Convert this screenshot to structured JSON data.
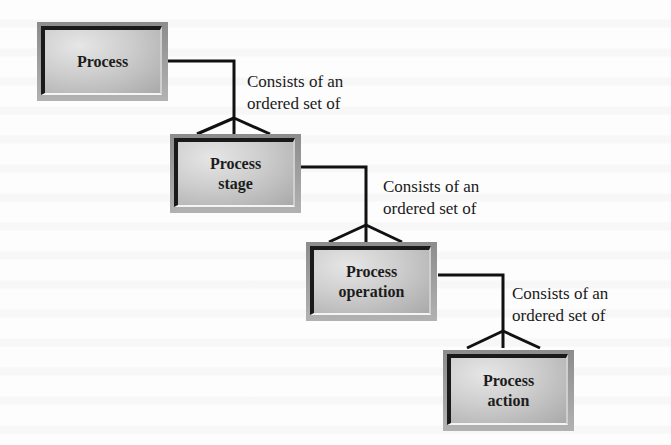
{
  "diagram": {
    "type": "hierarchy",
    "notation": "crow's foot (one-to-many)",
    "nodes": [
      {
        "id": "process",
        "label": "Process"
      },
      {
        "id": "process-stage",
        "label": "Process\nstage"
      },
      {
        "id": "process-operation",
        "label": "Process\noperation"
      },
      {
        "id": "process-action",
        "label": "Process\naction"
      }
    ],
    "relationships": [
      {
        "from": "process",
        "to": "process-stage",
        "label": "Consists of an\nordered set of"
      },
      {
        "from": "process-stage",
        "to": "process-operation",
        "label": "Consists of an\nordered set of"
      },
      {
        "from": "process-operation",
        "to": "process-action",
        "label": "Consists of an\nordered set of"
      }
    ]
  },
  "colors": {
    "line": "#111111",
    "box_face": "#cdcdcd",
    "box_frame": "#9e9e9e",
    "text": "#1c1c1c",
    "background": "#fdfdfd"
  }
}
